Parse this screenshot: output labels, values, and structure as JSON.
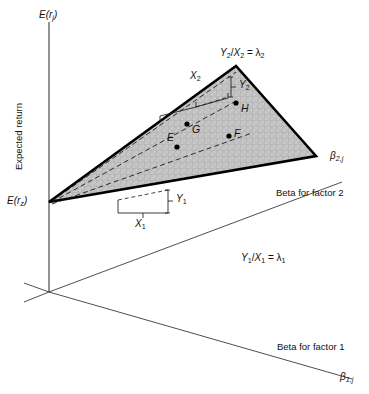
{
  "figure": {
    "domain": "diagram",
    "kind": "3d-plane-diagram",
    "background_color": "#ffffff",
    "line_color": "#1a1a1a",
    "plane_fill_color": "#c9c9c9",
    "plane_edge_color": "#000000",
    "axis_color": "#3a3a3a"
  },
  "axes": {
    "vertical": {
      "symbol_E": "E",
      "symbol_open": "(",
      "symbol_r": "r",
      "symbol_sub": "j",
      "symbol_close": ")",
      "title": "Expected return"
    },
    "factor2": {
      "name": "Beta for factor 2",
      "symbol_beta": "β",
      "symbol_sub": "2,j"
    },
    "factor1": {
      "name": "Beta for factor 1",
      "symbol_beta": "β",
      "symbol_sub": "1,j"
    }
  },
  "intercept": {
    "symbol_E": "E",
    "symbol_open": "(",
    "symbol_r": "r",
    "symbol_sub": "z",
    "symbol_close": ")"
  },
  "equations": {
    "lambda2": {
      "numerator": "Y",
      "numerator_sub": "2",
      "slash": "/",
      "denominator": "X",
      "denominator_sub": "2",
      "equals": "=",
      "lambda": "λ",
      "lambda_sub": "2"
    },
    "lambda1": {
      "numerator": "Y",
      "numerator_sub": "1",
      "slash": "/",
      "denominator": "X",
      "denominator_sub": "1",
      "equals": "=",
      "lambda": "λ",
      "lambda_sub": "1"
    }
  },
  "brackets": {
    "x2": {
      "symbol": "X",
      "sub": "2"
    },
    "y2": {
      "symbol": "Y",
      "sub": "2"
    },
    "x1": {
      "symbol": "X",
      "sub": "1"
    },
    "y1": {
      "symbol": "Y",
      "sub": "1"
    }
  },
  "points": [
    {
      "id": "point-e",
      "label": "E",
      "x": 177,
      "y": 147
    },
    {
      "id": "point-g",
      "label": "G",
      "x": 187,
      "y": 124
    },
    {
      "id": "point-f",
      "label": "F",
      "x": 229,
      "y": 136
    },
    {
      "id": "point-h",
      "label": "H",
      "x": 236,
      "y": 103
    }
  ],
  "geometry": {
    "origin": {
      "x": 49,
      "y": 292
    },
    "vertical_axis_top": {
      "x": 49,
      "y": 22
    },
    "plane_vertex_left": {
      "x": 49,
      "y": 202
    },
    "plane_vertex_apex": {
      "x": 236,
      "y": 66
    },
    "plane_vertex_right": {
      "x": 316,
      "y": 156
    }
  }
}
